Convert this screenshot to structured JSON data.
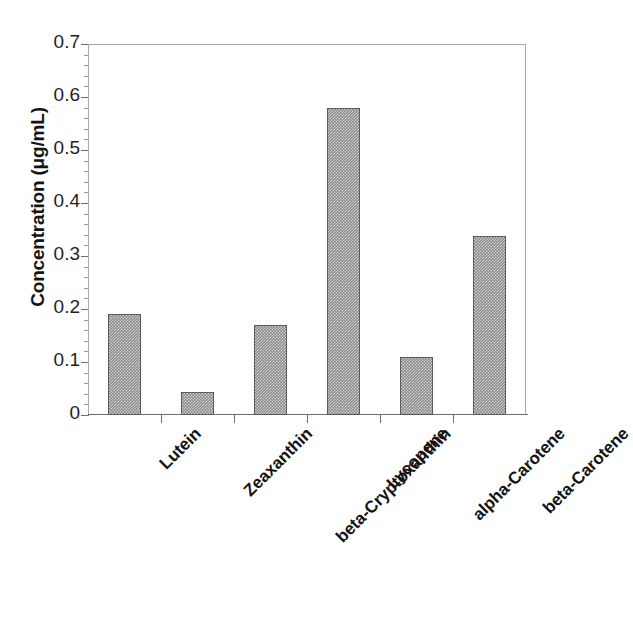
{
  "chart_data": {
    "type": "bar",
    "title": "",
    "xlabel": "",
    "ylabel": "Concentration (μg/mL)",
    "categories": [
      "Lutein",
      "Zeaxanthin",
      "beta-Cryptoxanthin",
      "Lycopene",
      "alpha-Carotene",
      "beta-Carotene"
    ],
    "values": [
      0.19,
      0.043,
      0.17,
      0.58,
      0.11,
      0.337
    ],
    "ylim": [
      0,
      0.7
    ],
    "ytick_labels": [
      "0.7",
      "0.6",
      "0.5",
      "0.4",
      "0.3",
      "0.2",
      "0.1",
      "0"
    ],
    "ytick_values": [
      0.7,
      0.6,
      0.5,
      0.4,
      0.3,
      0.2,
      0.1,
      0
    ],
    "ytick_step": 0.1,
    "minor_ticks": true,
    "grid": false,
    "legend": "none",
    "bar_color": "#8d8d8d",
    "bar_border_color": "#5a5a5a",
    "axis_color": "#6e6e6e",
    "frame_color": "#a8a8a8",
    "background_color": "#ffffff",
    "text_color": "#141414"
  },
  "axes": {
    "y_title": "Concentration (μg/mL)"
  }
}
